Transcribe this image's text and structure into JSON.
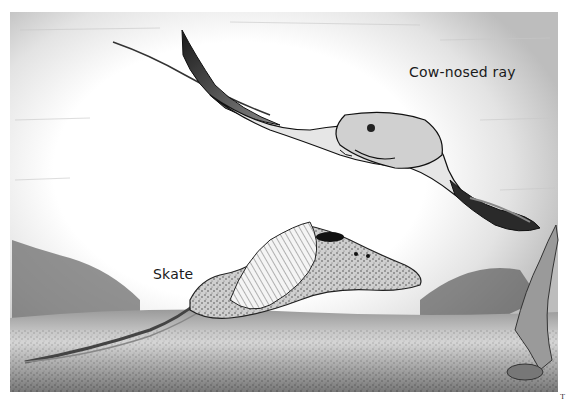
{
  "illustration": {
    "subject": "Underwater scene with two rays",
    "labels": {
      "cow_nosed_ray": "Cow-nosed ray",
      "skate": "Skate"
    },
    "page_mark": "T"
  },
  "colors": {
    "background": "#ffffff",
    "ink": "#1a1a1a",
    "water_tone": "#cfcfcf",
    "seafloor_tone": "#6b6b6b"
  }
}
